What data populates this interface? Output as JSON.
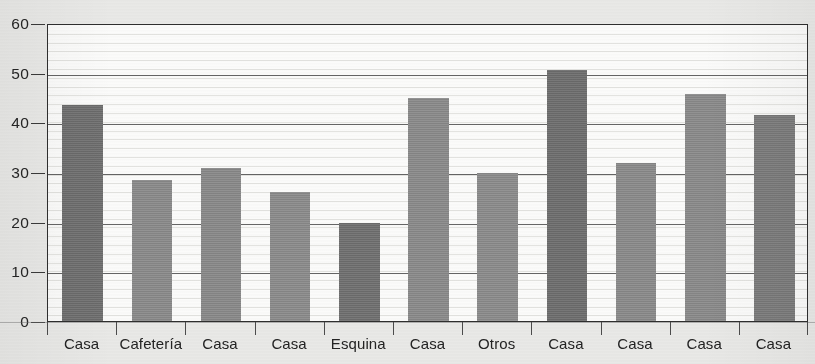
{
  "chart_data": {
    "type": "bar",
    "title": "",
    "xlabel": "",
    "ylabel": "",
    "ylim": [
      0,
      60
    ],
    "yticks": [
      0,
      10,
      20,
      30,
      40,
      50,
      60
    ],
    "ytick_labels": [
      "0",
      "10",
      "20",
      "30",
      "40",
      "50",
      "60"
    ],
    "grid": true,
    "legend": "none",
    "categories": [
      "Casa",
      "Cafetería",
      "Casa",
      "Casa",
      "Esquina",
      "Casa",
      "Otros",
      "Casa",
      "Casa",
      "Casa",
      "Casa"
    ],
    "values": [
      43.5,
      28.4,
      30.8,
      26.0,
      19.8,
      45.0,
      29.8,
      50.6,
      31.8,
      45.7,
      41.4
    ],
    "bar_colors": [
      "#6f6f6f",
      "#8b8b8b",
      "#8a8a8a",
      "#8c8c8c",
      "#707070",
      "#8b8b8b",
      "#8c8c8c",
      "#6e6e6e",
      "#8b8b8b",
      "#8b8b8b",
      "#7c7c7c"
    ]
  },
  "axis": {
    "y_tick_labels": [
      "60",
      "50",
      "40",
      "30",
      "20",
      "10",
      "0"
    ],
    "x_tick_labels": [
      "Casa",
      "Cafetería",
      "Casa",
      "Casa",
      "Esquina",
      "Casa",
      "Otros",
      "Casa",
      "Casa",
      "Casa",
      "Casa"
    ]
  },
  "style": {
    "plot_background": "#fbfbfa",
    "page_background": "#e9e9e7",
    "frame_color": "#2f2f2f",
    "gridline_color": "#4a4a4a",
    "text_color": "#232323"
  },
  "title_sliver": ""
}
